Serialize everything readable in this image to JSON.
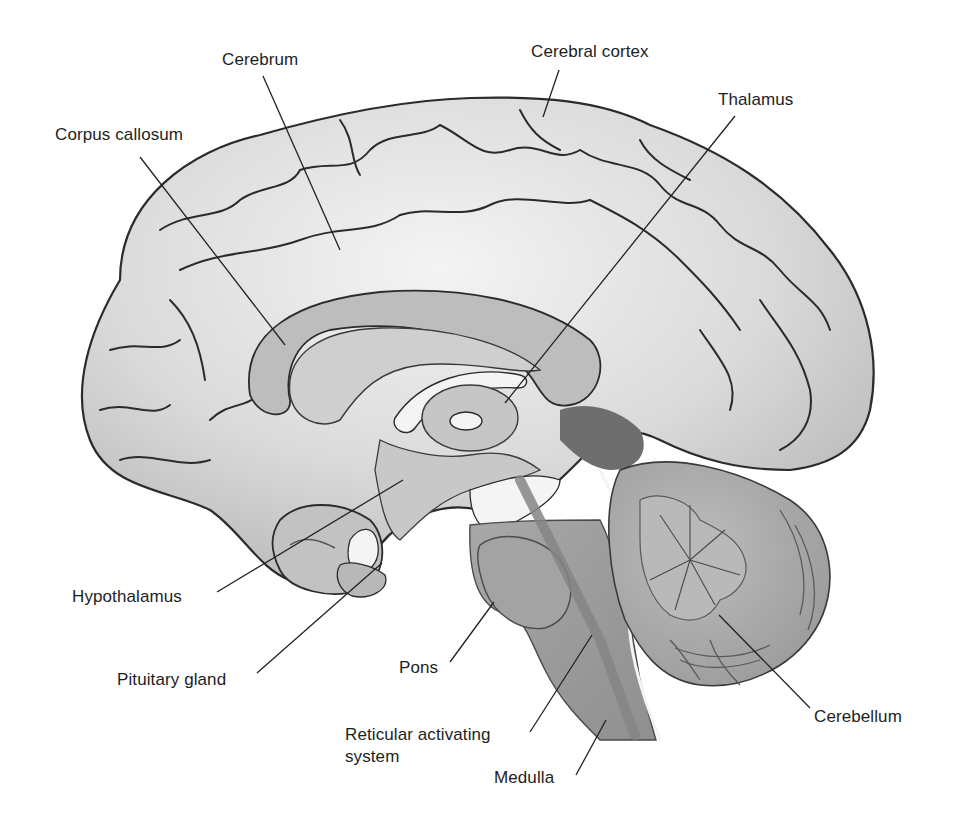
{
  "diagram": {
    "colors": {
      "background": "#ffffff",
      "cortex_fill": "#dcdcdc",
      "cortex_highlight": "#f2f2f2",
      "sulcus_line": "#2b2b2b",
      "corpus_callosum": "#bdbdbd",
      "ventricle_white": "#f4f4f4",
      "thalamus": "#c6c6c6",
      "brainstem": "#9c9c9c",
      "cerebellum_arbor": "#b4b4b4",
      "cerebellum_folia": "#9a9a9a",
      "deep_shadow": "#6e6e6e",
      "leader_line": "#222222",
      "label_text": "#1e1e1e"
    },
    "labels": [
      {
        "id": "cerebrum",
        "text": "Cerebrum",
        "x": 222,
        "y": 50,
        "line": [
          263,
          76,
          340,
          250
        ]
      },
      {
        "id": "cerebral-cortex",
        "text": "Cerebral cortex",
        "x": 531,
        "y": 42,
        "line": [
          559,
          70,
          543,
          117
        ]
      },
      {
        "id": "thalamus",
        "text": "Thalamus",
        "x": 718,
        "y": 90,
        "line": [
          735,
          116,
          505,
          403
        ]
      },
      {
        "id": "corpus-callosum",
        "text": "Corpus callosum",
        "x": 55,
        "y": 125,
        "line": [
          140,
          157,
          285,
          345
        ]
      },
      {
        "id": "hypothalamus",
        "text": "Hypothalamus",
        "x": 72,
        "y": 587,
        "line": [
          217,
          592,
          403,
          480
        ]
      },
      {
        "id": "pituitary-gland",
        "text": "Pituitary gland",
        "x": 117,
        "y": 670,
        "line": [
          257,
          673,
          382,
          563
        ]
      },
      {
        "id": "pons",
        "text": "Pons",
        "x": 399,
        "y": 658,
        "line": [
          450,
          662,
          494,
          602
        ]
      },
      {
        "id": "reticular-activating-system",
        "text": "Reticular activating system",
        "x": 345,
        "y": 724,
        "line": [
          530,
          732,
          592,
          635
        ]
      },
      {
        "id": "medulla",
        "text": "Medulla",
        "x": 494,
        "y": 768,
        "line": [
          576,
          775,
          606,
          720
        ]
      },
      {
        "id": "cerebellum",
        "text": "Cerebellum",
        "x": 814,
        "y": 707,
        "line": [
          810,
          708,
          719,
          615
        ]
      }
    ]
  }
}
